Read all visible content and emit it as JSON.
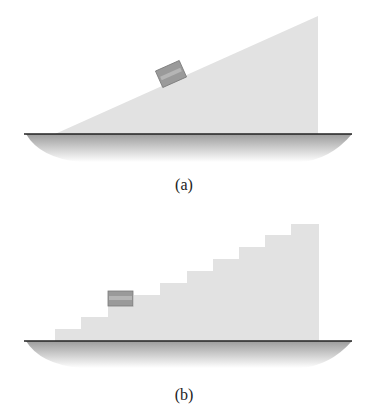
{
  "figure": {
    "panel_a": {
      "label": "(a)",
      "description": "Block on an inclined ramp (smooth slope)",
      "ramp_color": "#e2e2e2",
      "block_color": "#9a9a9a",
      "ground_color": "#222222",
      "shadow_color": "#b0b0b0"
    },
    "panel_b": {
      "label": "(b)",
      "description": "Block on a staircase",
      "step_count": 11,
      "stair_color": "#e2e2e2",
      "block_color": "#9a9a9a",
      "ground_color": "#222222",
      "shadow_color": "#b0b0b0"
    }
  }
}
